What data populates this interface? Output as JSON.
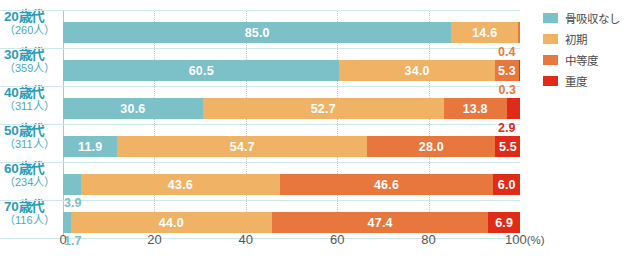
{
  "chart_data": {
    "type": "bar",
    "orientation": "horizontal",
    "stacked": true,
    "stack_total": 100,
    "title": "",
    "subtitle": "",
    "xlabel": "(%)",
    "ylabel": "",
    "xlim": [
      0,
      100
    ],
    "xticks": [
      "0",
      "20",
      "40",
      "60",
      "80",
      "100"
    ],
    "xunit": "(%)",
    "grid": true,
    "legend_position": "right",
    "categories": [
      "20歳代",
      "30歳代",
      "40歳代",
      "50歳代",
      "60歳代",
      "70歳代"
    ],
    "category_counts": [
      "（260人）",
      "（359人）",
      "（311人）",
      "（234人）",
      "（116人）"
    ],
    "series": [
      {
        "name": "骨吸収なし",
        "color": "#7cc0c8",
        "values": [
          85.0,
          60.5,
          30.6,
          11.9,
          3.9,
          1.7
        ]
      },
      {
        "name": "初期",
        "color": "#f0b265",
        "values": [
          14.6,
          34.0,
          52.7,
          54.7,
          43.6,
          44.0
        ]
      },
      {
        "name": "中等度",
        "color": "#e8773e",
        "values": [
          0.4,
          5.3,
          13.8,
          28.0,
          46.6,
          47.4
        ]
      },
      {
        "name": "重度",
        "color": "#e02b18",
        "values": [
          0.0,
          0.3,
          2.9,
          5.5,
          6.0,
          6.9
        ]
      }
    ],
    "rows": [
      {
        "age": "20歳代",
        "count": "（260人）",
        "segments": [
          {
            "series": "骨吸収なし",
            "value": 85.0,
            "label": "85.0",
            "label_inside": true,
            "color": "#7cc0c8"
          },
          {
            "series": "初期",
            "value": 14.6,
            "label": "14.6",
            "label_inside": true,
            "color": "#f0b265"
          },
          {
            "series": "中等度",
            "value": 0.4,
            "label": "0.4",
            "label_inside": false,
            "color": "#e8773e",
            "callout_color": "#e8773e"
          }
        ]
      },
      {
        "age": "30歳代",
        "count": "（359人）",
        "segments": [
          {
            "series": "骨吸収なし",
            "value": 60.5,
            "label": "60.5",
            "label_inside": true,
            "color": "#7cc0c8"
          },
          {
            "series": "初期",
            "value": 34.0,
            "label": "34.0",
            "label_inside": true,
            "color": "#f0b265"
          },
          {
            "series": "中等度",
            "value": 5.3,
            "label": "5.3",
            "label_inside": true,
            "color": "#e8773e"
          },
          {
            "series": "重度",
            "value": 0.3,
            "label": "0.3",
            "label_inside": false,
            "color": "#e02b18",
            "callout_color": "#e8773e"
          }
        ]
      },
      {
        "age": "40歳代",
        "count": "（311人）",
        "segments": [
          {
            "series": "骨吸収なし",
            "value": 30.6,
            "label": "30.6",
            "label_inside": true,
            "color": "#7cc0c8"
          },
          {
            "series": "初期",
            "value": 52.7,
            "label": "52.7",
            "label_inside": true,
            "color": "#f0b265"
          },
          {
            "series": "中等度",
            "value": 13.8,
            "label": "13.8",
            "label_inside": true,
            "color": "#e8773e"
          },
          {
            "series": "重度",
            "value": 2.9,
            "label": "2.9",
            "label_inside": false,
            "color": "#e02b18",
            "callout_color": "#e02b18"
          }
        ]
      },
      {
        "age": "50歳代",
        "count": "（311人）",
        "segments": [
          {
            "series": "骨吸収なし",
            "value": 11.9,
            "label": "11.9",
            "label_inside": true,
            "color": "#7cc0c8"
          },
          {
            "series": "初期",
            "value": 54.7,
            "label": "54.7",
            "label_inside": true,
            "color": "#f0b265"
          },
          {
            "series": "中等度",
            "value": 28.0,
            "label": "28.0",
            "label_inside": true,
            "color": "#e8773e"
          },
          {
            "series": "重度",
            "value": 5.5,
            "label": "5.5",
            "label_inside": true,
            "color": "#e02b18"
          }
        ]
      },
      {
        "age": "60歳代",
        "count": "（234人）",
        "segments": [
          {
            "series": "骨吸収なし",
            "value": 3.9,
            "label": "3.9",
            "label_inside": false,
            "color": "#7cc0c8",
            "callout_color": "#7cc0c8"
          },
          {
            "series": "初期",
            "value": 43.6,
            "label": "43.6",
            "label_inside": true,
            "color": "#f0b265"
          },
          {
            "series": "中等度",
            "value": 46.6,
            "label": "46.6",
            "label_inside": true,
            "color": "#e8773e"
          },
          {
            "series": "重度",
            "value": 6.0,
            "label": "6.0",
            "label_inside": true,
            "color": "#e02b18"
          }
        ]
      },
      {
        "age": "70歳代",
        "count": "（116人）",
        "segments": [
          {
            "series": "骨吸収なし",
            "value": 1.7,
            "label": "1.7",
            "label_inside": false,
            "color": "#7cc0c8",
            "callout_color": "#7cc0c8"
          },
          {
            "series": "初期",
            "value": 44.0,
            "label": "44.0",
            "label_inside": true,
            "color": "#f0b265"
          },
          {
            "series": "中等度",
            "value": 47.4,
            "label": "47.4",
            "label_inside": true,
            "color": "#e8773e"
          },
          {
            "series": "重度",
            "value": 6.9,
            "label": "6.9",
            "label_inside": true,
            "color": "#e02b18"
          }
        ]
      }
    ]
  },
  "legend": {
    "items": [
      {
        "label": "骨吸収なし",
        "color": "#7cc0c8"
      },
      {
        "label": "初期",
        "color": "#f0b265"
      },
      {
        "label": "中等度",
        "color": "#e8773e"
      },
      {
        "label": "重度",
        "color": "#e02b18"
      }
    ]
  },
  "axis": {
    "unit": "(%)",
    "ticks": [
      "0",
      "20",
      "40",
      "60",
      "80",
      "100"
    ]
  }
}
